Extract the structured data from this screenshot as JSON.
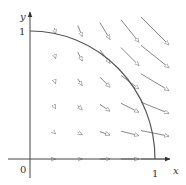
{
  "diagram": {
    "axes": {
      "x_label": "x",
      "y_label": "y",
      "origin_label": "0",
      "x_tick_label": "1",
      "y_tick_label": "1"
    },
    "curve": "quarter circle x^2 + y^2 = 1, first quadrant",
    "field_grid": {
      "x_values": [
        0.2,
        0.4,
        0.6,
        0.8,
        1.0
      ],
      "y_values": [
        0.0,
        0.2,
        0.4,
        0.6,
        0.8,
        1.0
      ]
    },
    "colors": {
      "axis": "#444444",
      "curve": "#555555",
      "arrow": "#888888"
    }
  }
}
